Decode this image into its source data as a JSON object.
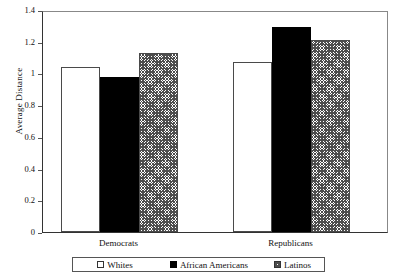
{
  "chart_data": {
    "type": "bar",
    "title": "",
    "xlabel": "",
    "ylabel": "Average Distance",
    "ylim": [
      0,
      1.4
    ],
    "yticks": [
      "0",
      "0.2",
      "0.4",
      "0.6",
      "0.8",
      "1",
      "1.2",
      "1.4"
    ],
    "ytick_values": [
      0,
      0.2,
      0.4,
      0.6,
      0.8,
      1.0,
      1.2,
      1.4
    ],
    "grid": false,
    "legend_position": "bottom",
    "categories": [
      "Democrats",
      "Republicans"
    ],
    "series": [
      {
        "name": "Whites",
        "style": "open",
        "values": [
          1.04,
          1.07
        ]
      },
      {
        "name": "African Americans",
        "style": "solid",
        "values": [
          0.98,
          1.29
        ]
      },
      {
        "name": "Latinos",
        "style": "hatch",
        "values": [
          1.13,
          1.21
        ]
      }
    ]
  },
  "legend": {
    "items": [
      {
        "label": "Whites",
        "marker": "open-square-icon"
      },
      {
        "label": "African Americans",
        "marker": "filled-square-icon"
      },
      {
        "label": "Latinos",
        "marker": "hatched-square-icon"
      }
    ]
  }
}
